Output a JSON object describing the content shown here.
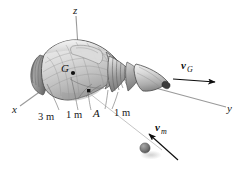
{
  "figure": {
    "background_color": "#ffffff",
    "width": 241,
    "height": 172
  },
  "axes": {
    "x_label": "x",
    "y_label": "y",
    "z_label": "z",
    "axis_color": "#9a9a9a"
  },
  "points": {
    "center_of_mass_label": "G",
    "impact_point_label": "A"
  },
  "dimensions": [
    {
      "label": "3 m"
    },
    {
      "label": "1 m"
    },
    {
      "label": "1 m"
    }
  ],
  "vectors": [
    {
      "name": "velocity-of-G",
      "symbol": "v",
      "subscript": "G",
      "arrow_color": "#0d0d0d"
    },
    {
      "name": "velocity-of-meteoroid",
      "symbol": "v",
      "subscript": "m",
      "arrow_color": "#0d0d0d"
    }
  ],
  "body": {
    "name": "space-capsule",
    "shell_light": "#e8e8e8",
    "shell_mid": "#c9c9c9",
    "shell_dark": "#8e8e8e",
    "outline_color": "#4a4a4a"
  },
  "meteoroid": {
    "name": "meteoroid-sphere",
    "fill_color": "#6e6e6e",
    "shadow_color": "#cfcfcf"
  }
}
